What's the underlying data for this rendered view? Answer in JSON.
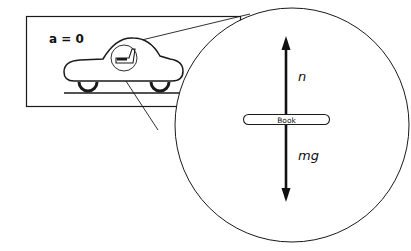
{
  "diagram": {
    "acceleration_label": "a = 0",
    "object_label": "Book",
    "normal_force_label": "n",
    "weight_label": "mg",
    "colors": {
      "stroke": "#1a1a1a",
      "background": "#ffffff"
    }
  }
}
